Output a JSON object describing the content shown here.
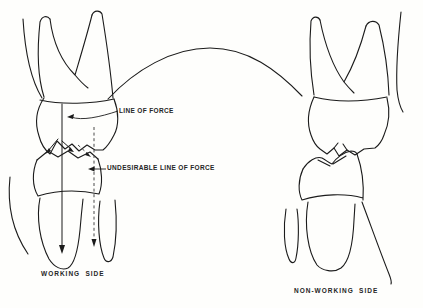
{
  "figure": {
    "type": "dental-occlusion-diagram",
    "background_color": "#fefefc",
    "ink_color": "#1b1b1b"
  },
  "labels": {
    "line_of_force": "LINE OF FORCE",
    "undesirable_line_of_force": "UNDESIRABLE LINE OF FORCE",
    "working_side": "WORKING SIDE",
    "non_working_side": "NON-WORKING SIDE"
  }
}
